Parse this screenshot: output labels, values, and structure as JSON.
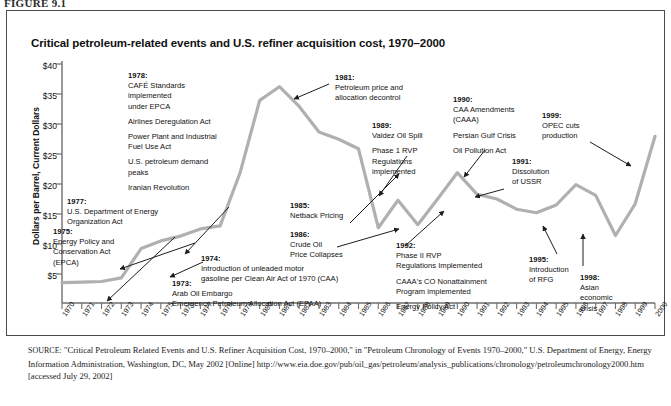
{
  "figure": {
    "label": "FIGURE 9.1"
  },
  "chart_title": "Critical petroleum-related events and U.S. refiner acquisition cost, 1970–2000",
  "axis": {
    "ylabel": "Dollars per Barrel, Current Dollars",
    "yticks": [
      "$40",
      "$35",
      "$30",
      "$25",
      "$20",
      "$15",
      "$10",
      "$5"
    ],
    "xticks": [
      "1970",
      "1971",
      "1972",
      "1973",
      "1974",
      "1975",
      "1976",
      "1977",
      "1978",
      "1979",
      "1980",
      "1981",
      "1982",
      "1983",
      "1984",
      "1985",
      "1986",
      "1987",
      "1988",
      "1989",
      "1990",
      "1991",
      "1992",
      "1993",
      "1994",
      "1995",
      "1996",
      "1997",
      "1998",
      "1999",
      "2000"
    ]
  },
  "annotations": [
    {
      "id": "a1978",
      "year": "1978:",
      "lines": [
        [
          "CAFÉ Standards",
          "implemented",
          "under EPCA"
        ],
        [
          "Airlines Deregulation Act"
        ],
        [
          "Power Plant and Industrial",
          "Fuel Use Act"
        ],
        [
          "U.S. petroleum demand",
          "peaks"
        ],
        [
          "Iranian Revolution"
        ]
      ]
    },
    {
      "id": "a1977",
      "year": "1977:",
      "lines": [
        [
          "U.S. Department of Energy",
          "Organization Act"
        ]
      ]
    },
    {
      "id": "a1975",
      "year": "1975:",
      "lines": [
        [
          "Energy Policy and",
          "Conservation Act",
          "(EPCA)"
        ]
      ]
    },
    {
      "id": "a1974",
      "year": "1974:",
      "lines": [
        [
          "Introduction of unleaded motor",
          "gasoline per Clean Air Act of 1970 (CAA)"
        ]
      ]
    },
    {
      "id": "a1973",
      "year": "1973:",
      "lines": [
        [
          "Arab Oil Embargo",
          "Emergency Petroleum Allocation Act (EPAA)"
        ]
      ]
    },
    {
      "id": "a1981",
      "year": "1981:",
      "lines": [
        [
          "Petroleum price and",
          "allocation decontrol"
        ]
      ]
    },
    {
      "id": "a1985",
      "year": "1985:",
      "lines": [
        [
          "Netback Pricing"
        ]
      ]
    },
    {
      "id": "a1986",
      "year": "1986:",
      "lines": [
        [
          "Crude Oil",
          "Price Collapses"
        ]
      ]
    },
    {
      "id": "a1989",
      "year": "1989:",
      "lines": [
        [
          "Valdez Oil Spill"
        ],
        [
          "Phase 1 RVP",
          "Regulations",
          "implemented"
        ]
      ]
    },
    {
      "id": "a1990",
      "year": "1990:",
      "lines": [
        [
          "CAA Amendments",
          "(CAAA)"
        ],
        [
          "Persian Gulf Crisis"
        ],
        [
          "Oil Pollution Act"
        ]
      ]
    },
    {
      "id": "a1991",
      "year": "1991:",
      "lines": [
        [
          "Dissolution",
          "of USSR"
        ]
      ]
    },
    {
      "id": "a1992",
      "year": "1992:",
      "lines": [
        [
          "Phase II RVP",
          "Regulations Implemented"
        ],
        [
          "CAAA's CO Nonattainment",
          "Program implemented"
        ],
        [
          "Energy Policy Act"
        ]
      ]
    },
    {
      "id": "a1995",
      "year": "1995:",
      "lines": [
        [
          "Introduction",
          "of RFG"
        ]
      ]
    },
    {
      "id": "a1998",
      "year": "1998:",
      "lines": [
        [
          "Asian",
          "economic",
          "crisis"
        ]
      ]
    },
    {
      "id": "a1999",
      "year": "1999:",
      "lines": [
        [
          "OPEC cuts",
          "production"
        ]
      ]
    }
  ],
  "source_note": {
    "prefix": "SOURCE:",
    "text": " \"Critical Petroleum Related Events and U.S. Refiner Acquisition Cost, 1970–2000,\" in \"Petroleum Chronology of Events 1970–2000,\" U.S. Department of Energy, Energy Information Administration, Washington, DC, May 2002 [Online] http://www.eia.doe.gov/pub/oil_gas/petroleum/analysis_publications/chronology/petroleumchronology2000.htm [accessed July 29, 2002]"
  },
  "colors": {
    "line": "#b0b0b0",
    "axis": "#6e6e6e",
    "text": "#111111",
    "frame": "#4a4a4a"
  },
  "chart_data": {
    "type": "line",
    "title": "Critical petroleum-related events and U.S. refiner acquisition cost, 1970–2000",
    "xlabel": "",
    "ylabel": "Dollars per Barrel, Current Dollars",
    "ylim": [
      0,
      40
    ],
    "xlim": [
      1970,
      2000
    ],
    "grid": false,
    "legend": "none",
    "x": [
      1970,
      1971,
      1972,
      1973,
      1974,
      1975,
      1976,
      1977,
      1978,
      1979,
      1980,
      1981,
      1982,
      1983,
      1984,
      1985,
      1986,
      1987,
      1988,
      1989,
      1990,
      1991,
      1992,
      1993,
      1994,
      1995,
      1996,
      1997,
      1998,
      1999,
      2000
    ],
    "values": [
      3.4,
      3.5,
      3.6,
      4.2,
      9.1,
      10.4,
      11.2,
      12.4,
      12.9,
      21.7,
      33.9,
      36.2,
      32.9,
      28.6,
      27.4,
      25.8,
      12.6,
      17.2,
      13.1,
      17.4,
      21.8,
      18.2,
      17.4,
      15.7,
      15.1,
      16.4,
      19.8,
      18.0,
      11.3,
      16.6,
      27.9
    ],
    "series": [
      {
        "name": "U.S. refiner acquisition cost",
        "values": [
          3.4,
          3.5,
          3.6,
          4.2,
          9.1,
          10.4,
          11.2,
          12.4,
          12.9,
          21.7,
          33.9,
          36.2,
          32.9,
          28.6,
          27.4,
          25.8,
          12.6,
          17.2,
          13.1,
          17.4,
          21.8,
          18.2,
          17.4,
          15.7,
          15.1,
          16.4,
          19.8,
          18.0,
          11.3,
          16.6,
          27.9
        ]
      }
    ]
  }
}
